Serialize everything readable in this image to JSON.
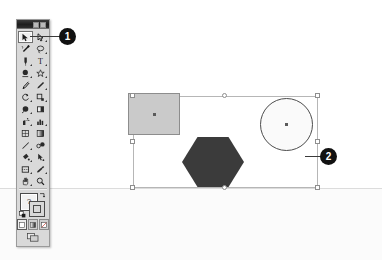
{
  "scene": {
    "title": "Illustrator toolbox and selected artwork",
    "background_color": "#ffffff",
    "lower_band_color": "#fbfbfb",
    "horizon_line_color": "#dcdcdc"
  },
  "toolbox": {
    "name": "Tools palette",
    "titlebar": {
      "collapse_button": "collapse",
      "close_button": "close"
    },
    "active_tool": "selection-tool",
    "rows": [
      {
        "left": {
          "icon": "selection-arrow-icon",
          "label": "Selection Tool",
          "active": true,
          "flyout": false
        },
        "right": {
          "icon": "direct-selection-arrow-icon",
          "label": "Direct Selection Tool",
          "active": false,
          "flyout": true
        }
      },
      {
        "left": {
          "icon": "magic-wand-icon",
          "label": "Magic Wand Tool",
          "active": false,
          "flyout": false
        },
        "right": {
          "icon": "lasso-icon",
          "label": "Lasso Tool",
          "active": false,
          "flyout": true
        }
      },
      {
        "left": {
          "icon": "pen-icon",
          "label": "Pen Tool",
          "active": false,
          "flyout": true
        },
        "right": {
          "icon": "type-icon",
          "label": "Type Tool",
          "active": false,
          "flyout": true
        }
      },
      {
        "left": {
          "icon": "line-segment-icon",
          "label": "Line Segment Tool",
          "active": false,
          "flyout": true
        },
        "right": {
          "icon": "shape-star-icon",
          "label": "Rectangle Tool",
          "active": false,
          "flyout": true
        }
      },
      {
        "left": {
          "icon": "paintbrush-icon",
          "label": "Paintbrush Tool",
          "active": false,
          "flyout": false
        },
        "right": {
          "icon": "pencil-icon",
          "label": "Pencil Tool",
          "active": false,
          "flyout": true
        }
      },
      {
        "left": {
          "icon": "rotate-icon",
          "label": "Rotate Tool",
          "active": false,
          "flyout": true
        },
        "right": {
          "icon": "scale-icon",
          "label": "Scale Tool",
          "active": false,
          "flyout": true
        }
      },
      {
        "left": {
          "icon": "warp-icon",
          "label": "Warp Tool",
          "active": false,
          "flyout": true
        },
        "right": {
          "icon": "free-transform-icon",
          "label": "Free Transform Tool",
          "active": false,
          "flyout": false
        }
      },
      {
        "left": {
          "icon": "symbol-sprayer-icon",
          "label": "Symbol Sprayer Tool",
          "active": false,
          "flyout": true
        },
        "right": {
          "icon": "column-graph-icon",
          "label": "Column Graph Tool",
          "active": false,
          "flyout": true
        }
      },
      {
        "left": {
          "icon": "mesh-icon",
          "label": "Mesh Tool",
          "active": false,
          "flyout": false
        },
        "right": {
          "icon": "gradient-icon",
          "label": "Gradient Tool",
          "active": false,
          "flyout": false
        }
      },
      {
        "left": {
          "icon": "eyedropper-icon",
          "label": "Eyedropper Tool",
          "active": false,
          "flyout": true
        },
        "right": {
          "icon": "blend-icon",
          "label": "Blend Tool",
          "active": false,
          "flyout": false
        }
      },
      {
        "left": {
          "icon": "live-paint-bucket-icon",
          "label": "Live Paint Bucket",
          "active": false,
          "flyout": true
        },
        "right": {
          "icon": "live-paint-selection-icon",
          "label": "Live Paint Selection",
          "active": false,
          "flyout": false
        }
      },
      {
        "left": {
          "icon": "slice-icon",
          "label": "Slice Tool",
          "active": false,
          "flyout": true
        },
        "right": {
          "icon": "eraser-icon",
          "label": "Eraser Tool",
          "active": false,
          "flyout": true
        }
      },
      {
        "left": {
          "icon": "hand-icon",
          "label": "Hand Tool",
          "active": false,
          "flyout": true
        },
        "right": {
          "icon": "zoom-magnifier-icon",
          "label": "Zoom Tool",
          "active": false,
          "flyout": false
        }
      }
    ],
    "fill_stroke": {
      "fill_label": "?",
      "fill_color": "#f2f2f2",
      "stroke_color": "#d9d9d9",
      "swap_icon": "swap-fill-stroke-icon",
      "default_icon": "default-fill-stroke-icon"
    },
    "paint_modes": [
      {
        "icon": "color-swatch-icon",
        "label": "Color",
        "selected": true
      },
      {
        "icon": "gradient-swatch-icon",
        "label": "Gradient",
        "selected": false
      },
      {
        "icon": "none-swatch-icon",
        "label": "None",
        "selected": false
      }
    ],
    "screen_modes": [
      {
        "icon": "screen-mode-icon",
        "label": "Change Screen Mode"
      }
    ]
  },
  "artwork": {
    "selection_label": "Selection bounding box",
    "bounds": {
      "x": 133,
      "y": 96,
      "width": 185,
      "height": 92
    },
    "handle_color": "#ffffff",
    "handle_border_color": "#8e8e8e",
    "box_border_color": "#b6b6b6",
    "shapes": [
      {
        "name": "rectangle-shape",
        "type": "rectangle",
        "fill": "#cacaca",
        "stroke": "#8d8d8d",
        "center_dot": true
      },
      {
        "name": "circle-shape",
        "type": "ellipse",
        "fill": "#fafafa",
        "stroke": "#4d4d4d",
        "center_dot": true
      },
      {
        "name": "hexagon-shape",
        "type": "polygon",
        "sides": 6,
        "fill": "#3b3b3b",
        "stroke": "#3b3b3b",
        "center_dot": false
      }
    ]
  },
  "callouts": [
    {
      "id": "callout-1",
      "number": "1",
      "points_to": "selection-tool"
    },
    {
      "id": "callout-2",
      "number": "2",
      "points_to": "selection-bounding-box"
    }
  ]
}
